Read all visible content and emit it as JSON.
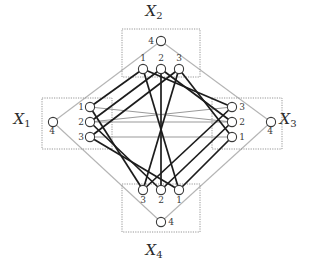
{
  "figure": {
    "type": "diagram",
    "kind": "4-partite permutation / latin-square graph",
    "width": 321,
    "height": 264,
    "background": "#ffffff"
  },
  "colors": {
    "dark_edge": "#1c1c1c",
    "gray_edge": "#9a9a9a",
    "outer_edge": "#b4b4b4",
    "node_stroke": "#3a3a3a",
    "node_fill": "#ffffff",
    "box_stroke": "#8a8a8a",
    "text": "#2b2b2b"
  },
  "groups": [
    {
      "id": "X1",
      "label": "X",
      "subscript": "1",
      "label_x": 22,
      "label_y": 124,
      "box": {
        "x": 42,
        "y": 98,
        "w": 70,
        "h": 51
      },
      "nodes": [
        {
          "id": "X1-4",
          "label": "4",
          "cx": 53,
          "cy": 122,
          "r": 4.6,
          "label_dx": -1,
          "label_dy": 12,
          "anchor": "middle"
        },
        {
          "id": "X1-1",
          "label": "1",
          "cx": 90,
          "cy": 107,
          "r": 4.6,
          "label_dx": -9,
          "label_dy": 3,
          "anchor": "middle"
        },
        {
          "id": "X1-2",
          "label": "2",
          "cx": 90,
          "cy": 122,
          "r": 4.6,
          "label_dx": -9,
          "label_dy": 3,
          "anchor": "middle"
        },
        {
          "id": "X1-3",
          "label": "3",
          "cx": 90,
          "cy": 137,
          "r": 4.6,
          "label_dx": -9,
          "label_dy": 3,
          "anchor": "middle"
        }
      ]
    },
    {
      "id": "X2",
      "label": "X",
      "subscript": "2",
      "label_x": 154,
      "label_y": 16,
      "box": {
        "x": 122,
        "y": 29,
        "w": 78,
        "h": 48
      },
      "nodes": [
        {
          "id": "X2-4",
          "label": "4",
          "cx": 161,
          "cy": 41,
          "r": 4.6,
          "label_dx": -10,
          "label_dy": 3,
          "anchor": "middle"
        },
        {
          "id": "X2-1",
          "label": "1",
          "cx": 143,
          "cy": 69,
          "r": 4.6,
          "label_dx": 0,
          "label_dy": -8,
          "anchor": "middle"
        },
        {
          "id": "X2-2",
          "label": "2",
          "cx": 161,
          "cy": 69,
          "r": 4.6,
          "label_dx": 0,
          "label_dy": -8,
          "anchor": "middle"
        },
        {
          "id": "X2-3",
          "label": "3",
          "cx": 179,
          "cy": 69,
          "r": 4.6,
          "label_dx": 0,
          "label_dy": -8,
          "anchor": "middle"
        }
      ]
    },
    {
      "id": "X3",
      "label": "X",
      "subscript": "3",
      "label_x": 288,
      "label_y": 124,
      "box": {
        "x": 212,
        "y": 98,
        "w": 70,
        "h": 51
      },
      "nodes": [
        {
          "id": "X3-4",
          "label": "4",
          "cx": 271,
          "cy": 122,
          "r": 4.6,
          "label_dx": -1,
          "label_dy": 12,
          "anchor": "middle"
        },
        {
          "id": "X3-3",
          "label": "3",
          "cx": 232,
          "cy": 107,
          "r": 4.6,
          "label_dx": 10,
          "label_dy": 3,
          "anchor": "middle"
        },
        {
          "id": "X3-2",
          "label": "2",
          "cx": 232,
          "cy": 122,
          "r": 4.6,
          "label_dx": 10,
          "label_dy": 3,
          "anchor": "middle"
        },
        {
          "id": "X3-1",
          "label": "1",
          "cx": 232,
          "cy": 137,
          "r": 4.6,
          "label_dx": 10,
          "label_dy": 3,
          "anchor": "middle"
        }
      ]
    },
    {
      "id": "X4",
      "label": "X",
      "subscript": "4",
      "label_x": 154,
      "label_y": 255,
      "box": {
        "x": 122,
        "y": 184,
        "w": 78,
        "h": 48
      },
      "nodes": [
        {
          "id": "X4-3",
          "label": "3",
          "cx": 143,
          "cy": 190,
          "r": 4.6,
          "label_dx": 0,
          "label_dy": 13,
          "anchor": "middle"
        },
        {
          "id": "X4-2",
          "label": "2",
          "cx": 161,
          "cy": 190,
          "r": 4.6,
          "label_dx": 0,
          "label_dy": 13,
          "anchor": "middle"
        },
        {
          "id": "X4-1",
          "label": "1",
          "cx": 179,
          "cy": 190,
          "r": 4.6,
          "label_dx": 0,
          "label_dy": 13,
          "anchor": "middle"
        },
        {
          "id": "X4-4",
          "label": "4",
          "cx": 161,
          "cy": 222,
          "r": 4.6,
          "label_dx": 10,
          "label_dy": 3,
          "anchor": "middle"
        }
      ]
    }
  ],
  "edges_outer": [
    {
      "from": "X1-4",
      "to": "X2-4"
    },
    {
      "from": "X2-4",
      "to": "X3-4"
    },
    {
      "from": "X3-4",
      "to": "X4-4"
    },
    {
      "from": "X4-4",
      "to": "X1-4"
    }
  ],
  "edges_gray_horizontal": [
    {
      "from": "X1-1",
      "to": "X3-2"
    },
    {
      "from": "X1-2",
      "to": "X3-3"
    },
    {
      "from": "X1-2",
      "to": "X3-2"
    },
    {
      "from": "X1-3",
      "to": "X3-1"
    }
  ],
  "edges_dark": [
    {
      "from": "X1-1",
      "to": "X2-1"
    },
    {
      "from": "X1-2",
      "to": "X2-2"
    },
    {
      "from": "X1-3",
      "to": "X2-3"
    },
    {
      "from": "X1-1",
      "to": "X4-3"
    },
    {
      "from": "X1-2",
      "to": "X4-2"
    },
    {
      "from": "X1-3",
      "to": "X4-1"
    },
    {
      "from": "X2-1",
      "to": "X3-3"
    },
    {
      "from": "X2-2",
      "to": "X3-2"
    },
    {
      "from": "X2-3",
      "to": "X3-1"
    },
    {
      "from": "X4-3",
      "to": "X3-3"
    },
    {
      "from": "X4-2",
      "to": "X3-2"
    },
    {
      "from": "X4-1",
      "to": "X3-1"
    },
    {
      "from": "X2-1",
      "to": "X4-1"
    },
    {
      "from": "X2-2",
      "to": "X4-2"
    },
    {
      "from": "X2-3",
      "to": "X4-3"
    }
  ]
}
